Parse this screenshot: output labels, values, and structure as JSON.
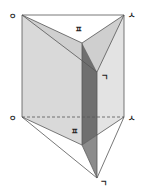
{
  "diagram": {
    "type": "triangular-prism-cut",
    "colors": {
      "face_light": "#dcdcdc",
      "face_mid": "#c8c8c8",
      "face_dark": "#6e6e6e",
      "face_darker": "#8a8a8a",
      "edge": "#555555",
      "background": "#ffffff"
    },
    "labels": {
      "top_left": "ㅇ",
      "top_right": "ㅅ",
      "top_mid": "ㅍ",
      "mid_right": "ㄱ",
      "bottom_left": "ㅇ",
      "bottom_right": "ㅅ",
      "bottom_mid": "ㅍ",
      "bottom_point": "ㄱ"
    }
  }
}
